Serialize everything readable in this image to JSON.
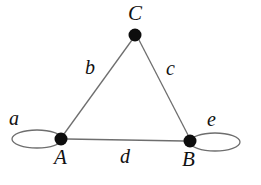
{
  "figure": {
    "kind": "graph-diagram",
    "background_color": "#ffffff",
    "stroke_color": "#6e6e6e",
    "vertex_color": "#0d0d0d",
    "label_color": "#111111",
    "width": 261,
    "height": 185
  },
  "vertices": [
    {
      "id": "C",
      "label": "C",
      "cx": 135,
      "cy": 35,
      "r": 6.5,
      "label_x": 128,
      "label_y": 3
    },
    {
      "id": "A",
      "label": "A",
      "cx": 61,
      "cy": 139,
      "r": 6.5,
      "label_x": 54,
      "label_y": 147
    },
    {
      "id": "B",
      "label": "B",
      "cx": 190,
      "cy": 141,
      "r": 6.5,
      "label_x": 182,
      "label_y": 149
    }
  ],
  "edges": [
    {
      "id": "b",
      "label": "b",
      "from": "A",
      "to": "C",
      "x1": 64,
      "y1": 134,
      "x2": 132,
      "y2": 40,
      "label_x": 85,
      "label_y": 57
    },
    {
      "id": "c",
      "label": "c",
      "from": "C",
      "to": "B",
      "x1": 139,
      "y1": 40,
      "x2": 188,
      "y2": 135,
      "label_x": 166,
      "label_y": 58
    },
    {
      "id": "d",
      "label": "d",
      "from": "A",
      "to": "B",
      "x1": 67,
      "y1": 139,
      "x2": 184,
      "y2": 141,
      "label_x": 120,
      "label_y": 146
    }
  ],
  "loops": [
    {
      "id": "a",
      "label": "a",
      "at": "A",
      "cx": 37,
      "cy": 139,
      "rx": 25,
      "ry": 9,
      "label_x": 9,
      "label_y": 108
    },
    {
      "id": "e",
      "label": "e",
      "at": "B",
      "cx": 215,
      "cy": 142,
      "rx": 25,
      "ry": 9,
      "label_x": 207,
      "label_y": 109
    }
  ]
}
